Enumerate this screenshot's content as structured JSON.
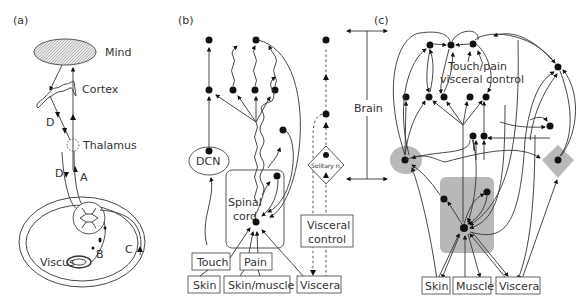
{
  "figure": {
    "panel_a": {
      "label": "(a)",
      "mind": "Mind",
      "cortex": "Cortex",
      "thalamus": "Thalamus",
      "viscus": "Viscus",
      "pathway_labels": [
        "D",
        "D",
        "A",
        "B",
        "C"
      ]
    },
    "panel_b": {
      "label": "(b)",
      "dcn": "DCN",
      "spinal_cord_line1": "Spinal",
      "spinal_cord_line2": "cord",
      "solitary": "Solitary n.",
      "visceral_control_line1": "Visceral",
      "visceral_control_line2": "control",
      "touch": "Touch",
      "pain": "Pain",
      "skin": "Skin",
      "skin_muscle": "Skin/muscle",
      "viscera": "Viscera",
      "brain": "Brain"
    },
    "panel_c": {
      "label": "(c)",
      "center_line1": "Touch/pain",
      "center_line2": "visceral control",
      "skin": "Skin",
      "muscle": "Muscle",
      "viscera": "Viscera"
    }
  }
}
